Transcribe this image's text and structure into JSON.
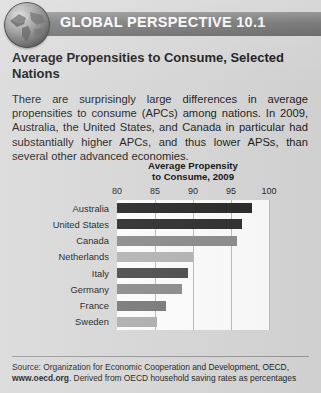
{
  "banner": {
    "title": "GLOBAL PERSPECTIVE 10.1",
    "icon": "globe-icon",
    "bar_color": "#6f6f6f"
  },
  "feature": {
    "title": "Average Propensities to Consume, Selected Nations",
    "body": "There are surprisingly large differences in average propensities to consume (APCs) among nations. In 2009, Australia, the United States, and Canada in particular had substantially higher APCs, and thus lower APSs, than several other advanced economies."
  },
  "chart_data": {
    "type": "bar",
    "orientation": "horizontal",
    "title": "Average Propensity to Consume, 2009",
    "title_line1": "Average Propensity",
    "title_line2": "to Consume, 2009",
    "xlabel": "",
    "ylabel": "",
    "xlim": [
      80,
      100
    ],
    "ticks": [
      80,
      85,
      90,
      95,
      100
    ],
    "grid": true,
    "legend": "none",
    "categories": [
      "Australia",
      "United States",
      "Canada",
      "Netherlands",
      "Italy",
      "Germany",
      "France",
      "Sweden"
    ],
    "values": [
      97.7,
      96.5,
      95.8,
      90.0,
      89.4,
      88.5,
      86.5,
      85.2
    ],
    "bar_colors": [
      "#282828",
      "#2e2e2e",
      "#8d8d8d",
      "#b6b6b6",
      "#4d4d4d",
      "#8d8d8d",
      "#7a7a7a",
      "#b0b0b0"
    ]
  },
  "source": {
    "prefix": "Source: Organization for Economic Cooperation and Development, OECD,",
    "site": "www.oecd.org",
    "suffix": ". Derived from OECD household saving rates as percentages"
  }
}
